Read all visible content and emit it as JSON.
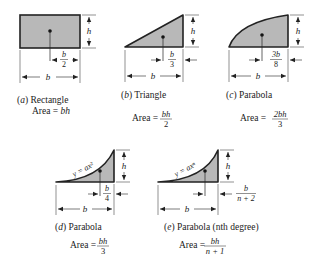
{
  "colors": {
    "fill": "#b8b8b8",
    "stroke": "#222222",
    "background": "#ffffff"
  },
  "shapes": [
    {
      "id": "a",
      "letter": "a",
      "name": "Rectangle",
      "area_label": "Area =",
      "area_num": "bh",
      "area_den": "",
      "dim_h": "h",
      "dim_b": "b",
      "centroid_num": "b",
      "centroid_den": "2"
    },
    {
      "id": "b",
      "letter": "b",
      "name": "Triangle",
      "area_label": "Area =",
      "area_num": "bh",
      "area_den": "2",
      "dim_h": "h",
      "dim_b": "b",
      "centroid_num": "b",
      "centroid_den": "3"
    },
    {
      "id": "c",
      "letter": "c",
      "name": "Parabola",
      "area_label": "Area =",
      "area_num": "2bh",
      "area_den": "3",
      "dim_h": "h",
      "dim_b": "b",
      "centroid_num": "3b",
      "centroid_den": "8"
    },
    {
      "id": "d",
      "letter": "d",
      "name": "Parabola",
      "area_label": "Area =",
      "area_num": "bh",
      "area_den": "3",
      "dim_h": "h",
      "dim_b": "b",
      "centroid_num": "b",
      "centroid_den": "4",
      "curve_eq": "y = ax²"
    },
    {
      "id": "e",
      "letter": "e",
      "name": "Parabola (nth degree)",
      "area_label": "Area =",
      "area_num": "bh",
      "area_den": "n + 1",
      "dim_h": "h",
      "dim_b": "b",
      "centroid_num": "b",
      "centroid_den": "n + 2",
      "curve_eq": "y = axⁿ"
    }
  ]
}
